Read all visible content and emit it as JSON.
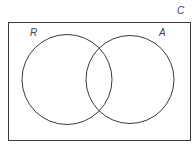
{
  "diagram": {
    "type": "venn",
    "universe": {
      "label": "C",
      "rect": {
        "x": 8,
        "y": 22,
        "width": 183,
        "height": 119
      }
    },
    "sets": [
      {
        "label": "R",
        "cx": 67,
        "cy": 79.5,
        "r": 45,
        "label_x": 30,
        "label_y": 36
      },
      {
        "label": "A",
        "cx": 130,
        "cy": 79.5,
        "r": 44,
        "label_x": 159,
        "label_y": 36
      }
    ],
    "universe_label_pos": {
      "x": 177,
      "y": 14
    },
    "stroke_color": "#3a3a3a",
    "label_color": "#444444"
  }
}
